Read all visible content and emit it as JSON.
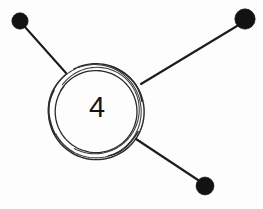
{
  "canvas": {
    "width": 263,
    "height": 209,
    "background_color": "#fdfdfd",
    "ink_color": "#1c1c1c",
    "style": "hand-drawn-sketch"
  },
  "diagram": {
    "type": "node-link-hub-and-spoke",
    "hub": {
      "label": "4",
      "name": "hub-node",
      "center_x": 96,
      "center_y": 111,
      "outer_radius": 48,
      "inner_radius": 41,
      "stroke_color": "#2a2a2a",
      "fill_color": "#fdfdfd",
      "rendering": "double-ring-sketchy-arcs"
    },
    "nodes": [
      {
        "name": "node-top-left",
        "center_x": 20,
        "center_y": 21,
        "radius": 8.2,
        "fill_color": "#121212",
        "shape": "filled-circle"
      },
      {
        "name": "node-top-right",
        "center_x": 245,
        "center_y": 19,
        "radius": 10.2,
        "fill_color": "#121212",
        "shape": "filled-circle"
      },
      {
        "name": "node-bottom-right",
        "center_x": 205,
        "center_y": 186,
        "radius": 9.0,
        "fill_color": "#121212",
        "shape": "filled-circle"
      }
    ],
    "edges": [
      {
        "name": "edge-hub-to-top-left",
        "from": "node-top-left",
        "to": "hub-node",
        "x1": 25,
        "y1": 27,
        "x2": 66,
        "y2": 73,
        "stroke_color": "#1c1c1c",
        "stroke_width": 2.1
      },
      {
        "name": "edge-hub-to-top-right",
        "from": "node-top-right",
        "to": "hub-node",
        "x1": 237,
        "y1": 26,
        "x2": 141,
        "y2": 84,
        "stroke_color": "#1c1c1c",
        "stroke_width": 2.1
      },
      {
        "name": "edge-hub-to-bottom-right",
        "from": "node-bottom-right",
        "to": "hub-node",
        "x1": 198,
        "y1": 180,
        "x2": 136,
        "y2": 139,
        "stroke_color": "#1c1c1c",
        "stroke_width": 2.1
      }
    ],
    "node_count": 4,
    "edge_count": 3
  }
}
